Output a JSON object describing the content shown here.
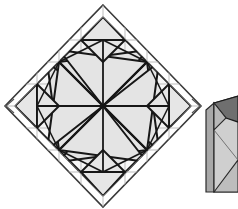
{
  "figure": {
    "title": "Crease pattern diamond with folded prism model",
    "background_color": "#ffffff",
    "width": 238,
    "height": 209
  },
  "palette": {
    "fill_light": "#eeeeee",
    "fill_mid": "#e2e2e2",
    "fill_panel": "#d9d9d9",
    "fill_dark": "#6f6f6f",
    "fill_shadow": "#8d8d8d",
    "stroke_dark": "#1a1a1a",
    "stroke_mid": "#555555",
    "stroke_light": "#a9a9a9",
    "stroke_grid": "#bdbdbd",
    "white": "#ffffff"
  },
  "crease_pattern": {
    "name": "diamond-crease-pattern",
    "label": "Square sheet rotated 45 degrees",
    "outer_diamond": {
      "top": [
        103,
        5
      ],
      "right": [
        201,
        106
      ],
      "bottom": [
        103,
        207
      ],
      "left": [
        5,
        106
      ]
    },
    "inner_diamond": {
      "top": [
        103,
        17
      ],
      "right": [
        191,
        106
      ],
      "bottom": [
        103,
        196
      ],
      "left": [
        15,
        106
      ]
    },
    "center": [
      103,
      106
    ],
    "grid_step": 22,
    "notes": "pinwheel of eight shaded triangles radiating from center"
  },
  "prism_model": {
    "name": "folded-prism-model",
    "label": "Assembled triangular prism",
    "box": {
      "x": 206,
      "y": 100,
      "w": 32,
      "h": 92
    },
    "top_vertex": [
      238,
      96
    ],
    "front_face_color": "#d9d9d9",
    "top_face_color": "#6f6f6f",
    "side_face_color": "#b5b5b5"
  },
  "arrow_marks": {
    "name": "chevron-marks",
    "left_chevron": "«",
    "right_chevron": "»",
    "left_position": [
      8,
      106
    ],
    "right_position": [
      196,
      106
    ]
  }
}
